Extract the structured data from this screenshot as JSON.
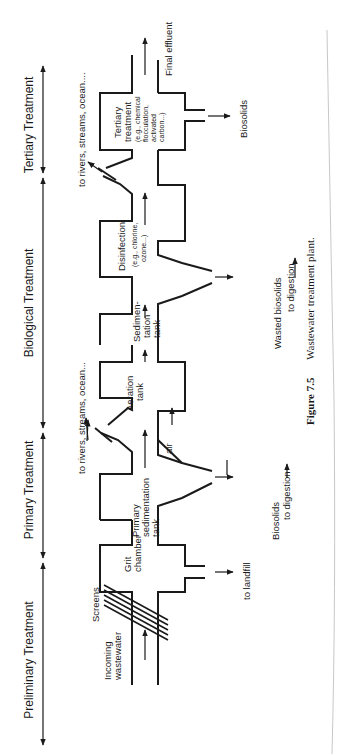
{
  "stages": [
    {
      "label": "Preliminary Treatment"
    },
    {
      "label": "Primary Treatment"
    },
    {
      "label": "Biological Treatment"
    },
    {
      "label": "Tertiary Treatment"
    }
  ],
  "units": {
    "incoming": {
      "line1": "Incoming",
      "line2": "wastewater"
    },
    "screens": "Screens",
    "grit": {
      "line1": "Grit",
      "line2": "chamber"
    },
    "primary": {
      "line1": "Primary",
      "line2": "sedimentation",
      "line3": "tank"
    },
    "aeration": {
      "line1": "Aeration",
      "line2": "tank"
    },
    "sedimentation": {
      "line1": "Sedimen-",
      "line2": "tation",
      "line3": "tank"
    },
    "disinfection": {
      "line1": "Disinfection",
      "line2": "(e.g., chlorine,",
      "line3": "ozone...)"
    },
    "tertiary": {
      "line1": "Tertiary",
      "line2": "treatment",
      "line3": "(e.g., chemical",
      "line4": "flocculation,",
      "line5": "activated",
      "line6": "carbon...)"
    },
    "final": "Final effluent"
  },
  "outputs": {
    "landfill": "to landfill",
    "biosolids_primary": {
      "line1": "Biosolids",
      "line2": "to digestion"
    },
    "air": "air",
    "wasted": {
      "line1": "Wasted biosolids",
      "line2": "to digestion"
    },
    "biosolids_tertiary": "Biosolids",
    "rivers1": "to rivers, streams, ocean...",
    "rivers2": "to rivers, streams, ocean...."
  },
  "caption": {
    "figure": "Figure 7.5",
    "text": "Wastewater treatment plant."
  },
  "colors": {
    "ink": "#1a1a1a",
    "paper": "#ffffff"
  }
}
